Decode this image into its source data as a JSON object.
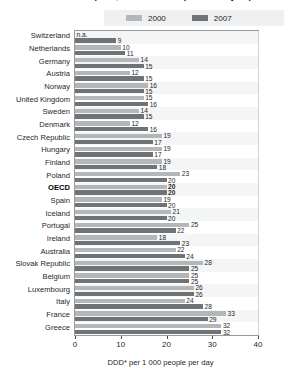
{
  "title": "Antibacterials consumption, 2000 and 2007 (or nearest year)",
  "legend": {
    "position": "top",
    "items": [
      {
        "label": "2000",
        "color": "#b4b7b9",
        "name": "series-2000"
      },
      {
        "label": "2007",
        "color": "#6f7375",
        "name": "series-2007"
      }
    ]
  },
  "axis": {
    "ticks": [
      "0",
      "10",
      "20",
      "30",
      "40"
    ],
    "caption": "DDD* per 1 000 people per day"
  },
  "chart_data": {
    "type": "bar",
    "orientation": "horizontal",
    "title": "Antibacterials consumption, 2000 and 2007 (or nearest year)",
    "xlabel": "DDD* per 1 000 people per day",
    "ylabel": "",
    "xlim": [
      0,
      40
    ],
    "grid": true,
    "legend_position": "top",
    "categories": [
      "Switzerland",
      "Netherlands",
      "Germany",
      "Austria",
      "Norway",
      "United Kingdom",
      "Sweden",
      "Denmark",
      "Czech Republic",
      "Hungary",
      "Finland",
      "Poland",
      "OECD",
      "Spain",
      "Iceland",
      "Portugal",
      "Ireland",
      "Australia",
      "Slovak Republic",
      "Belgium",
      "Luxembourg",
      "Italy",
      "France",
      "Greece"
    ],
    "highlight_category": "OECD",
    "series": [
      {
        "name": "2000",
        "color": "#b4b7b9",
        "values": [
          null,
          10,
          14,
          12,
          16,
          15,
          14,
          12,
          19,
          19,
          19,
          23,
          20,
          19,
          21,
          25,
          18,
          22,
          28,
          25,
          26,
          24,
          33,
          32
        ],
        "labels": [
          "n.a.",
          "10",
          "14",
          "12",
          "16",
          "15",
          "14",
          "12",
          "19",
          "19",
          "19",
          "23",
          "20",
          "19",
          "21",
          "25",
          "18",
          "22",
          "28",
          "25",
          "26",
          "24",
          "33",
          "32"
        ]
      },
      {
        "name": "2007",
        "color": "#6f7375",
        "values": [
          9,
          11,
          15,
          15,
          15,
          16,
          15,
          16,
          17,
          17,
          18,
          20,
          20,
          20,
          20,
          22,
          23,
          24,
          25,
          25,
          26,
          28,
          29,
          32
        ],
        "labels": [
          "9",
          "11",
          "15",
          "15",
          "15",
          "16",
          "15",
          "16",
          "17",
          "17",
          "18",
          "20",
          "20",
          "20",
          "20",
          "22",
          "23",
          "24",
          "25",
          "25",
          "26",
          "28",
          "29",
          "32"
        ]
      }
    ]
  }
}
